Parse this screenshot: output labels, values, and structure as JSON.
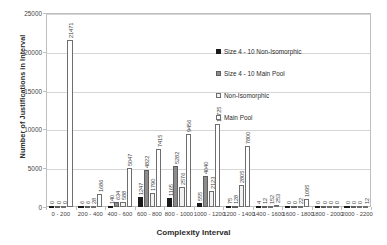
{
  "chart_data": {
    "type": "bar",
    "title": "",
    "xlabel": "Complexity Interval",
    "ylabel": "Number of Justifications in Interval",
    "ylim": [
      0,
      25000
    ],
    "yticks": [
      0,
      5000,
      10000,
      15000,
      20000,
      25000
    ],
    "ytick_labels": [
      "0",
      "5000",
      "10000",
      "15000",
      "20000",
      "25000"
    ],
    "grid": true,
    "legend_position": "inside-right",
    "categories": [
      "0 - 200",
      "200 - 400",
      "400 - 600",
      "600 - 800",
      "800 - 1000",
      "1000 - 1200",
      "1200 - 1400",
      "1400 - 1600",
      "1600 - 1800",
      "1800 - 2000",
      "2000 - 2200"
    ],
    "series": [
      {
        "name": "Size 4 - 10 Non-Isomorphic",
        "color": "#1a1a1a",
        "values": [
          0,
          6,
          140,
          1247,
          1165,
          555,
          75,
          4,
          0,
          0,
          0
        ]
      },
      {
        "name": "Size 4 - 10 Main Pool",
        "color": "#8c8c8c",
        "values": [
          0,
          6,
          634,
          4822,
          5282,
          4040,
          128,
          12,
          0,
          0,
          0
        ]
      },
      {
        "name": "Non-Isomorphic",
        "color": "#f2f2f2",
        "values": [
          167,
          28,
          588,
          1790,
          2576,
          2123,
          2805,
          152,
          22,
          0,
          0
        ]
      },
      {
        "name": "Main Pool",
        "color": "#ffffff",
        "values": [
          21471,
          1686,
          5047,
          7415,
          9456,
          10725,
          7800,
          253,
          1095,
          0,
          12
        ]
      }
    ],
    "bar_labels": [
      [
        "0",
        "0",
        "0",
        "21471"
      ],
      [
        "6",
        "6",
        "28",
        "1686"
      ],
      [
        "140",
        "634",
        "588",
        "5047"
      ],
      [
        "1247",
        "4822",
        "1790",
        "7415"
      ],
      [
        "1165",
        "5282",
        "2576",
        "9456"
      ],
      [
        "555",
        "4040",
        "2123",
        "10725"
      ],
      [
        "75",
        "128",
        "2805",
        "7800"
      ],
      [
        "4",
        "12",
        "152",
        "253"
      ],
      [
        "0",
        "0",
        "22",
        "1095"
      ],
      [
        "0",
        "0",
        "0",
        "0"
      ],
      [
        "0",
        "0",
        "0",
        "12"
      ]
    ]
  }
}
